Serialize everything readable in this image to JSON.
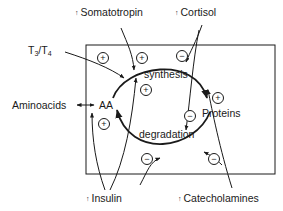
{
  "diagram": {
    "hormones": {
      "somatotropin": {
        "label": "Somatotropin",
        "indicator": "up-arrow"
      },
      "cortisol": {
        "label": "Cortisol",
        "indicator": "up-arrow"
      },
      "t3t4": {
        "label_main": "T",
        "sub1": "3",
        "slash": "/T",
        "sub2": "4"
      },
      "insulin": {
        "label": "Insulin",
        "indicator": "up-arrow"
      },
      "catecholamines": {
        "label": "Catecholamines",
        "indicator": "up-arrow"
      }
    },
    "nodes": {
      "aminoacids": "Aminoacids",
      "aa": "AA",
      "proteins": "Proteins",
      "synthesis": "synthesis",
      "degradation": "degradation"
    },
    "signs": {
      "plus": "+",
      "minus": "−"
    },
    "arrow_glyph": "↑",
    "colors": {
      "ink": "#1a1a1a",
      "background": "#ffffff"
    }
  }
}
